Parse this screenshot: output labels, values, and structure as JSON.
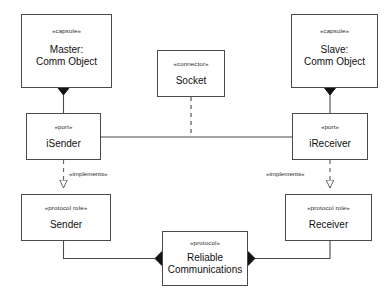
{
  "diagram": {
    "background_color": "#ffffff",
    "line_color": "#4a4a4a",
    "text_color": "#101010",
    "nodes": {
      "master": {
        "stereotype": "«capsule»",
        "name_line1": "Master:",
        "name_line2": "Comm Object"
      },
      "socket": {
        "stereotype": "«connector»",
        "name_line1": "Socket",
        "name_line2": ""
      },
      "slave": {
        "stereotype": "«capsule»",
        "name_line1": "Slave:",
        "name_line2": "Comm Object"
      },
      "isender": {
        "stereotype": "«port»",
        "name_line1": "iSender",
        "name_line2": ""
      },
      "ireceiver": {
        "stereotype": "«port»",
        "name_line1": "iReceiver",
        "name_line2": ""
      },
      "sender": {
        "stereotype": "«protocol role»",
        "name_line1": "Sender",
        "name_line2": ""
      },
      "receiver": {
        "stereotype": "«protocol role»",
        "name_line1": "Receiver",
        "name_line2": ""
      },
      "protocol": {
        "stereotype": "«protocol»",
        "name_line1": "Reliable",
        "name_line2": "Communications"
      }
    },
    "edges": {
      "implements_left": "«implements»",
      "implements_right": "«implements»"
    }
  }
}
